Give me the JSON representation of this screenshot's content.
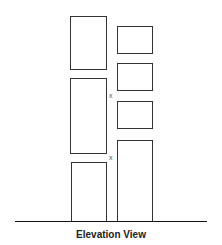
{
  "diagram": {
    "caption": "Elevation View",
    "markers": [
      {
        "label": "x",
        "x": 109,
        "y": 92
      },
      {
        "label": "x",
        "x": 109,
        "y": 154
      }
    ],
    "left_column": [
      {
        "x": 70,
        "y": 16,
        "w": 36,
        "h": 54
      },
      {
        "x": 70,
        "y": 78,
        "w": 36,
        "h": 75
      },
      {
        "x": 71,
        "y": 162,
        "w": 35,
        "h": 59
      }
    ],
    "right_column": [
      {
        "x": 117,
        "y": 26,
        "w": 35,
        "h": 28
      },
      {
        "x": 117,
        "y": 63,
        "w": 35,
        "h": 28
      },
      {
        "x": 117,
        "y": 101,
        "w": 35,
        "h": 28
      },
      {
        "x": 117,
        "y": 140,
        "w": 35,
        "h": 81
      }
    ],
    "ground": {
      "x1": 15,
      "x2": 207,
      "y": 221
    }
  }
}
